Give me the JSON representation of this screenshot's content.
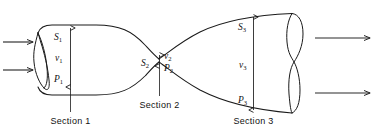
{
  "figure": {
    "background_color": "#ffffff",
    "line_color": "#1a1a1a",
    "width": 376,
    "height": 136
  },
  "sections": [
    {
      "id": "section-1",
      "caption": "Section 1",
      "area_symbol": "S",
      "area_sub": "1",
      "velocity_symbol": "v",
      "velocity_sub": "1",
      "pressure_symbol": "P",
      "pressure_sub": "1"
    },
    {
      "id": "section-2",
      "caption": "Section 2",
      "area_symbol": "S",
      "area_sub": "2",
      "velocity_symbol": "v",
      "velocity_sub": "2",
      "pressure_symbol": "P",
      "pressure_sub": "2"
    },
    {
      "id": "section-3",
      "caption": "Section 3",
      "area_symbol": "S",
      "area_sub": "3",
      "velocity_symbol": "v",
      "velocity_sub": "3",
      "pressure_symbol": "P",
      "pressure_sub": "3"
    }
  ],
  "flow": {
    "inlet_arrow_count": 2,
    "outlet_arrow_count": 2,
    "direction": "left-to-right"
  }
}
